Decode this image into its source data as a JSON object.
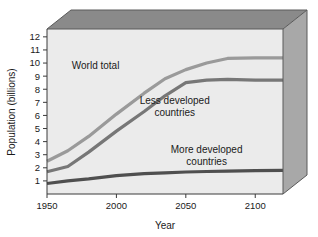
{
  "chart_data": {
    "type": "line",
    "title": "",
    "xlabel": "Year",
    "ylabel": "Population (billions)",
    "xlim": [
      1950,
      2120
    ],
    "ylim": [
      0,
      12.6
    ],
    "grid": false,
    "legend_position": "inline-annotations",
    "xticks": [
      1950,
      2000,
      2050,
      2100
    ],
    "xtick_labels": [
      "1950",
      "2000",
      "2050",
      "2100"
    ],
    "yticks": [
      1,
      2,
      3,
      4,
      5,
      6,
      7,
      8,
      9,
      10,
      11,
      12
    ],
    "ytick_labels": [
      "1",
      "2",
      "3",
      "4",
      "5",
      "6",
      "7",
      "8",
      "9",
      "10",
      "11",
      "12"
    ],
    "series": [
      {
        "name": "World total",
        "color": "#9a9a9a",
        "x": [
          1950,
          1965,
          1980,
          2000,
          2020,
          2035,
          2050,
          2065,
          2080,
          2100,
          2120
        ],
        "values": [
          2.5,
          3.3,
          4.4,
          6.1,
          7.7,
          8.8,
          9.5,
          10.0,
          10.35,
          10.4,
          10.4
        ]
      },
      {
        "name": "Less developed countries",
        "color": "#777777",
        "x": [
          1950,
          1965,
          1980,
          2000,
          2020,
          2035,
          2050,
          2065,
          2080,
          2100,
          2120
        ],
        "values": [
          1.7,
          2.1,
          3.2,
          4.8,
          6.3,
          7.5,
          8.5,
          8.7,
          8.75,
          8.7,
          8.7
        ]
      },
      {
        "name": "More developed countries",
        "color": "#4f4f4f",
        "x": [
          1950,
          1965,
          1980,
          2000,
          2020,
          2035,
          2050,
          2065,
          2080,
          2100,
          2120
        ],
        "values": [
          0.8,
          1.0,
          1.15,
          1.4,
          1.55,
          1.62,
          1.68,
          1.72,
          1.75,
          1.78,
          1.8
        ]
      }
    ],
    "annotations": [
      {
        "name": "world-total",
        "text": "World total",
        "x": 1985,
        "y": 9.55
      },
      {
        "name": "less-developed",
        "text_line1": "Less developed",
        "text_line2": "countries",
        "x": 2042,
        "y": 6.85
      },
      {
        "name": "more-developed",
        "text_line1": "More developed",
        "text_line2": "countries",
        "x": 2065,
        "y": 3.1
      }
    ],
    "colors": {
      "plot_face": "#ebebeb",
      "box_top": "#8a8a8a",
      "box_right": "#a8a8a8",
      "box_outline": "#5a5a5a",
      "axis": "#3a3a3a",
      "text": "#1a1a1a"
    }
  }
}
